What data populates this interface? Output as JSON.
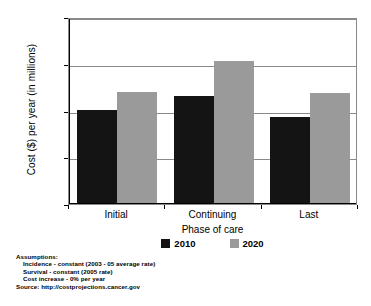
{
  "chart_data": {
    "type": "bar",
    "title": "",
    "xlabel": "Phase of care",
    "ylabel": "Cost ($) per year (in millions)",
    "categories": [
      "Initial",
      "Continuing",
      "Last"
    ],
    "series": [
      {
        "name": "2010",
        "color": "#141414",
        "values": [
          40300,
          46300,
          37200
        ]
      },
      {
        "name": "2020",
        "color": "#9a9a9a",
        "values": [
          48000,
          61200,
          47500
        ]
      }
    ],
    "ylim": [
      0,
      80000
    ],
    "yticks": [
      0,
      20000,
      40000,
      60000,
      80000
    ],
    "ytick_labels": [
      "0",
      "20,000",
      "40,000",
      "60,000",
      "80,000"
    ],
    "grid": true,
    "legend_position": "bottom"
  },
  "footnotes": {
    "heading": "Assumptions:",
    "lines": [
      "Incidence - constant (2003 - 05 average rate)",
      "Survival - constant (2005 rate)",
      "Cost increase - 0% per year"
    ],
    "source": "Source: http://costprojections.cancer.gov"
  }
}
